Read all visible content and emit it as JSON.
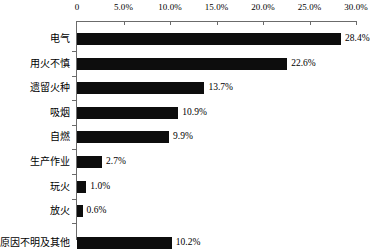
{
  "chart_data": {
    "type": "bar",
    "orientation": "horizontal",
    "title": "",
    "subtitle": "",
    "xlabel": "",
    "ylabel": "",
    "xlim": [
      0,
      30
    ],
    "grid": false,
    "legend": null,
    "axis_position": "top",
    "value_suffix": "%",
    "tick_labels": [
      "0",
      "5.0%",
      "10.0%",
      "15.0%",
      "20.0%",
      "25.0%",
      "30.0%"
    ],
    "tick_values": [
      0,
      5,
      10,
      15,
      20,
      25,
      30
    ],
    "categories": [
      "电气",
      "用火不慎",
      "遗留火种",
      "吸烟",
      "自燃",
      "生产作业",
      "玩火",
      "放火",
      "原因不明及其他"
    ],
    "values": [
      28.4,
      22.6,
      13.7,
      10.9,
      9.9,
      2.7,
      1.0,
      0.6,
      10.2
    ],
    "value_labels": [
      "28.4%",
      "22.6%",
      "13.7%",
      "10.9%",
      "9.9%",
      "2.7%",
      "1.0%",
      "0.6%",
      "10.2%"
    ],
    "bar_color": "#0d0d0d",
    "axis_color": "#6b6b6b",
    "text_color": "#000000",
    "background_color": "#ffffff"
  }
}
